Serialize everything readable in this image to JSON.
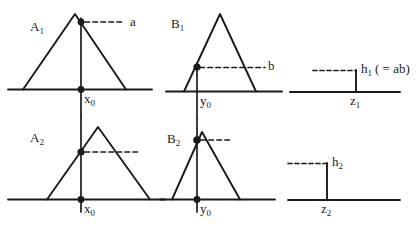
{
  "figure": {
    "title": "",
    "stroke_color": "#1a1a1a",
    "background_color": "#ffffff",
    "panels": [
      {
        "id": "A1",
        "label": "A",
        "subscript": "1",
        "baseline_label": "x",
        "baseline_subscript": "0",
        "value_label": "a"
      },
      {
        "id": "B1",
        "label": "B",
        "subscript": "1",
        "baseline_label": "y",
        "baseline_subscript": "0",
        "value_label": "b"
      },
      {
        "id": "Z1",
        "height_label": "h",
        "height_subscript": "1",
        "height_note": "( = ab)",
        "baseline_label": "z",
        "baseline_subscript": "1"
      },
      {
        "id": "A2",
        "label": "A",
        "subscript": "2",
        "baseline_label": "x",
        "baseline_subscript": "0",
        "value_label": ""
      },
      {
        "id": "B2",
        "label": "B",
        "subscript": "2",
        "baseline_label": "y",
        "baseline_subscript": "0",
        "value_label": ""
      },
      {
        "id": "Z2",
        "height_label": "h",
        "height_subscript": "2",
        "height_note": "",
        "baseline_label": "z",
        "baseline_subscript": "2"
      }
    ],
    "labels": {
      "a1_name": "A",
      "a1_sub": "1",
      "a1_x0": "x",
      "a1_x0_sub": "0",
      "a1_a": "a",
      "b1_name": "B",
      "b1_sub": "1",
      "b1_y0": "y",
      "b1_y0_sub": "0",
      "b1_b": "b",
      "z1_h": "h",
      "z1_h_sub": "1",
      "z1_h_note": "( = ab)",
      "z1_z": "z",
      "z1_z_sub": "1",
      "a2_name": "A",
      "a2_sub": "2",
      "a2_x0": "x",
      "a2_x0_sub": "0",
      "b2_name": "B",
      "b2_sub": "2",
      "b2_y0": "y",
      "b2_y0_sub": "0",
      "z2_h": "h",
      "z2_h_sub": "2",
      "z2_z": "z",
      "z2_z_sub": "2"
    }
  }
}
